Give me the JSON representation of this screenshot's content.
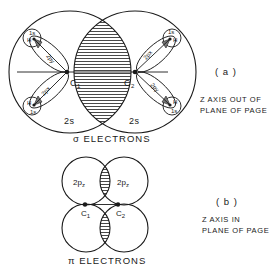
{
  "figure": {
    "panel_a": {
      "label": "( a )",
      "caption": "σ ELECTRONS",
      "axis_note_line1": "Z AXIS OUT OF",
      "axis_note_line2": "PLANE OF PAGE",
      "atoms": {
        "c1": "C",
        "c1_sub": "1",
        "c2": "C",
        "c2_sub": "2"
      },
      "orbital_labels": {
        "left_2s": "2s",
        "right_2s": "2s",
        "left_upper_p": "2py",
        "left_lower_p": "2px",
        "right_upper_p": "2px",
        "right_lower_p": "2py",
        "hydrogen": "H",
        "h_orbital": "1s"
      }
    },
    "panel_b": {
      "label": "( b )",
      "caption": "π ELECTRONS",
      "axis_note_line1": "Z AXIS IN",
      "axis_note_line2": "PLANE OF PAGE",
      "atoms": {
        "c1": "C",
        "c1_sub": "1",
        "c2": "C",
        "c2_sub": "2"
      },
      "orbital_labels": {
        "left": "2p",
        "left_sub": "z",
        "right": "2p",
        "right_sub": "z"
      }
    }
  }
}
